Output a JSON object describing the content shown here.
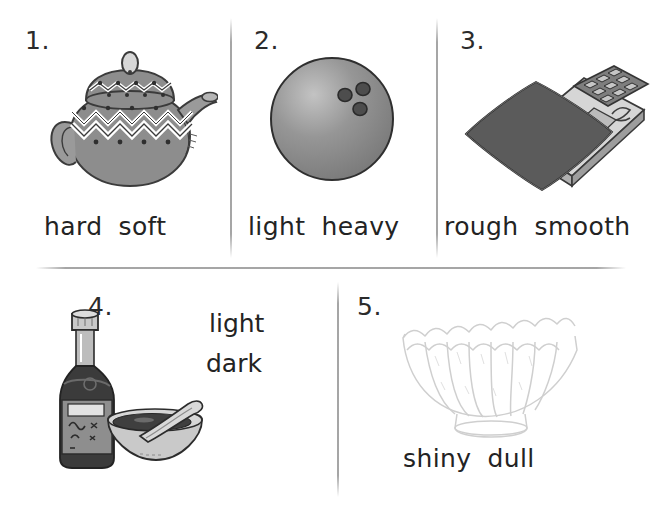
{
  "worksheet": {
    "type": "opposites-picture-worksheet",
    "background": "#ffffff",
    "ink": "#232323"
  },
  "items": [
    {
      "number": "1.",
      "picture": "teapot",
      "picture_desc": "gray decorated teapot with zigzag band, lid and spout",
      "choices": [
        "hard",
        "soft"
      ],
      "layout": "words-below"
    },
    {
      "number": "2.",
      "picture": "bowling-ball",
      "picture_desc": "gray bowling ball with three finger holes",
      "choices": [
        "light",
        "heavy"
      ],
      "layout": "words-below"
    },
    {
      "number": "3.",
      "picture": "sandpaper-on-calculator",
      "picture_desc": "dark rough sheet lying on a smooth electronic calculator",
      "choices": [
        "rough",
        "smooth"
      ],
      "layout": "words-below"
    },
    {
      "number": "4.",
      "picture": "soy-sauce-bottle-and-bowl",
      "picture_desc": "dark soy sauce bottle beside a light bowl with dark sauce and a spoon",
      "choices": [
        "light",
        "dark"
      ],
      "layout": "words-stacked-right"
    },
    {
      "number": "5.",
      "picture": "scalloped-glass-bowl",
      "picture_desc": "faint outline drawing of a fluted glass bowl on a pedestal foot",
      "choices": [
        "shiny",
        "dull"
      ],
      "layout": "words-below"
    }
  ],
  "colors": {
    "rule": "#969696",
    "teapot_body": "#8d8d8d",
    "teapot_dark": "#6a6a6a",
    "ball": "#8b8b8b",
    "ball_hole": "#4a4a4a",
    "rough_sheet": "#5e5e5e",
    "calculator": "#d2d2d2",
    "bottle": "#3a3a3a",
    "bowl_light": "#c9c9c9",
    "sauce": "#3d3d3d",
    "glass_outline": "#cfcfcf"
  }
}
